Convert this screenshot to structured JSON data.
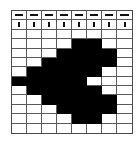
{
  "puzzle": {
    "columns": 8,
    "header_rows": [
      {
        "hint_icon": "dash-icon",
        "cells": [
          "—",
          "—",
          "—",
          "—",
          "—",
          "—",
          "—",
          "—"
        ]
      },
      {
        "hint_icon": "bar-icon",
        "cells": [
          "▮",
          "▮",
          "▮",
          "▮",
          "▮",
          "▮",
          "▮",
          "▮"
        ]
      }
    ],
    "grid": [
      [
        0,
        0,
        0,
        0,
        0,
        0,
        0,
        0
      ],
      [
        0,
        0,
        0,
        0,
        1,
        1,
        0,
        0
      ],
      [
        0,
        0,
        0,
        1,
        1,
        1,
        1,
        0
      ],
      [
        0,
        0,
        1,
        1,
        1,
        1,
        1,
        0
      ],
      [
        0,
        1,
        1,
        1,
        1,
        1,
        0,
        0
      ],
      [
        1,
        1,
        1,
        1,
        1,
        0,
        0,
        0
      ],
      [
        0,
        1,
        1,
        1,
        1,
        1,
        0,
        0
      ],
      [
        0,
        0,
        1,
        1,
        1,
        1,
        1,
        0
      ],
      [
        0,
        0,
        0,
        1,
        1,
        1,
        1,
        0
      ],
      [
        0,
        0,
        0,
        0,
        1,
        1,
        0,
        0
      ],
      [
        0,
        0,
        0,
        0,
        0,
        0,
        0,
        0
      ]
    ],
    "colors": {
      "filled": "#000000",
      "empty": "#ffffff",
      "grid_line": "#5a5a5a"
    }
  }
}
